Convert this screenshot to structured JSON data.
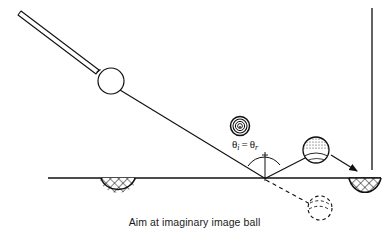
{
  "figure": {
    "caption": "Aim at imaginary image ball",
    "angle_label": {
      "theta": "θ",
      "sub_incident": "i",
      "equals": "=",
      "sub_reflected": "r",
      "full": "θi = θr"
    },
    "colors": {
      "ink": "#101010",
      "line": "#1a1a1a",
      "fill": "#ffffff",
      "shade": "#d9d9d9",
      "background": "#ffffff"
    },
    "elements": {
      "cue_stick": "cue-stick",
      "cue_ball": "cue-ball",
      "aim_line": "aim-line",
      "ghost_ball": "ghost-target-ball",
      "object_ball": "object-ball",
      "image_ball": "imaginary-image-ball",
      "side_pocket": "side-pocket",
      "corner_pocket": "corner-pocket",
      "bottom_rail": "bottom-rail",
      "right_rail": "right-rail",
      "normal_line": "normal-line",
      "reflect_line": "reflected-path-line",
      "dashed_line": "dashed-image-line",
      "pocket_arrow": "pocket-arrow",
      "angle_arc_incident": "angle-arc-incident",
      "angle_arc_reflected": "angle-arc-reflected"
    },
    "geometry": {
      "contact_point": [
        265,
        178
      ],
      "cue_ball_center": [
        111,
        81
      ],
      "cue_ball_radius": 13,
      "ghost_ball_center": [
        240,
        126
      ],
      "ghost_ball_radius": 9,
      "object_ball_center": [
        316,
        150
      ],
      "object_ball_radius": 13,
      "image_ball_center": [
        320,
        208
      ],
      "image_ball_radius": 12,
      "side_pocket_center": [
        118,
        178
      ],
      "corner_pocket_center": [
        365,
        178
      ],
      "rail_y": 178,
      "right_rail_x": 372
    }
  }
}
